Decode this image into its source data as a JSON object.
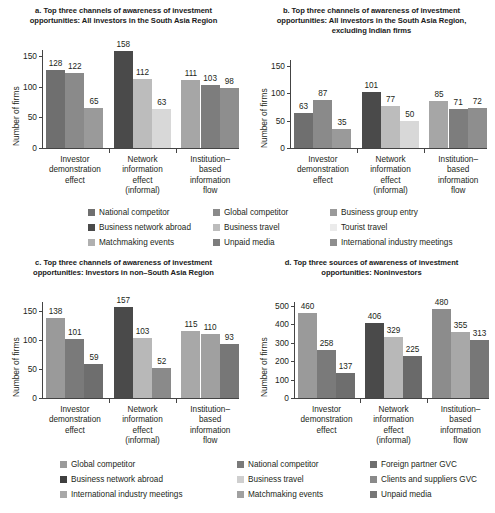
{
  "chart_data": [
    {
      "id": "a",
      "type": "bar",
      "title": "a. Top three channels of awareness of investment opportunities: All investors in the South Asia Region",
      "xlabel": "",
      "ylabel": "Number of firms",
      "ylim": [
        0,
        160
      ],
      "yticks": [
        0,
        50,
        100,
        150
      ],
      "grid": false,
      "categories": [
        "Investor demonstration effect",
        "Network information effect (informal)",
        "Institution–based information flow"
      ],
      "groups": [
        {
          "category": "Investor demonstration effect",
          "bars": [
            {
              "series": "National competitor",
              "value": 128,
              "color": "#6f6f6f"
            },
            {
              "series": "Global competitor",
              "value": 122,
              "color": "#8a8a8a"
            },
            {
              "series": "Business group entry",
              "value": 65,
              "color": "#9a9a9a"
            }
          ]
        },
        {
          "category": "Network information effect (informal)",
          "bars": [
            {
              "series": "Business network abroad",
              "value": 158,
              "color": "#4a4a4a"
            },
            {
              "series": "Business travel",
              "value": 112,
              "color": "#bcbcbc"
            },
            {
              "series": "Tourist travel",
              "value": 63,
              "color": "#d8d8d8"
            }
          ]
        },
        {
          "category": "Institution–based information flow",
          "bars": [
            {
              "series": "Matchmaking events",
              "value": 111,
              "color": "#a6a6a6"
            },
            {
              "series": "Unpaid media",
              "value": 103,
              "color": "#7d7d7d"
            },
            {
              "series": "International industry meetings",
              "value": 98,
              "color": "#8e8e8e"
            }
          ]
        }
      ]
    },
    {
      "id": "b",
      "type": "bar",
      "title": "b. Top three channels of awareness of investment opportunities: All investors in the South Asia Region, excluding Indian firms",
      "xlabel": "",
      "ylabel": "Number of firms",
      "ylim": [
        0,
        160
      ],
      "yticks": [
        0,
        50,
        100,
        150
      ],
      "grid": false,
      "categories": [
        "Investor demonstration effect",
        "Network information effect (informal)",
        "Institution–based information flow"
      ],
      "groups": [
        {
          "category": "Investor demonstration effect",
          "bars": [
            {
              "series": "National competitor",
              "value": 63,
              "color": "#6f6f6f"
            },
            {
              "series": "Global competitor",
              "value": 87,
              "color": "#8a8a8a"
            },
            {
              "series": "Business group entry",
              "value": 35,
              "color": "#9a9a9a"
            }
          ]
        },
        {
          "category": "Network information effect (informal)",
          "bars": [
            {
              "series": "Business network abroad",
              "value": 101,
              "color": "#4a4a4a"
            },
            {
              "series": "Business travel",
              "value": 77,
              "color": "#bcbcbc"
            },
            {
              "series": "Tourist travel",
              "value": 50,
              "color": "#d8d8d8"
            }
          ]
        },
        {
          "category": "Institution–based information flow",
          "bars": [
            {
              "series": "Matchmaking events",
              "value": 85,
              "color": "#a6a6a6"
            },
            {
              "series": "Unpaid media",
              "value": 71,
              "color": "#7d7d7d"
            },
            {
              "series": "International industry meetings",
              "value": 72,
              "color": "#8e8e8e"
            }
          ]
        }
      ]
    },
    {
      "id": "c",
      "type": "bar",
      "title": "c. Top three channels of awareness of investment opportunities: Investors in non–South Asia Region",
      "xlabel": "",
      "ylabel": "Number of firms",
      "ylim": [
        0,
        165
      ],
      "yticks": [
        0,
        50,
        100,
        150
      ],
      "grid": false,
      "categories": [
        "Investor demonstration effect",
        "Network information effect (informal)",
        "Institution–based information flow"
      ],
      "groups": [
        {
          "category": "Investor demonstration effect",
          "bars": [
            {
              "series": "Global competitor",
              "value": 138,
              "color": "#9a9a9a"
            },
            {
              "series": "National competitor",
              "value": 101,
              "color": "#7a7a7a"
            },
            {
              "series": "Foreign partner GVC",
              "value": 59,
              "color": "#6e6e6e"
            }
          ]
        },
        {
          "category": "Network information effect (informal)",
          "bars": [
            {
              "series": "Business network abroad",
              "value": 157,
              "color": "#4a4a4a"
            },
            {
              "series": "Business travel",
              "value": 103,
              "color": "#b8b8b8"
            },
            {
              "series": "Clients and suppliers GVC",
              "value": 52,
              "color": "#8a8a8a"
            }
          ]
        },
        {
          "category": "Institution–based information flow",
          "bars": [
            {
              "series": "International industry meetings",
              "value": 115,
              "color": "#a8a8a8"
            },
            {
              "series": "Matchmaking events",
              "value": 110,
              "color": "#a0a0a0"
            },
            {
              "series": "Unpaid media",
              "value": 93,
              "color": "#777777"
            }
          ]
        }
      ]
    },
    {
      "id": "d",
      "type": "bar",
      "title": "d. Top three sources of awareness of investment opportunities: Noninvestors",
      "xlabel": "",
      "ylabel": "Number of firms",
      "ylim": [
        0,
        520
      ],
      "yticks": [
        0,
        100,
        200,
        300,
        400,
        500
      ],
      "grid": false,
      "categories": [
        "Investor demonstration effect",
        "Network information effect (informal)",
        "Institution–based information flow"
      ],
      "groups": [
        {
          "category": "Investor demonstration effect",
          "bars": [
            {
              "series": "Global competitor",
              "value": 460,
              "color": "#9a9a9a"
            },
            {
              "series": "National competitor",
              "value": 258,
              "color": "#7a7a7a"
            },
            {
              "series": "Foreign partner GVC",
              "value": 137,
              "color": "#6e6e6e"
            }
          ]
        },
        {
          "category": "Network information effect (informal)",
          "bars": [
            {
              "series": "Business network abroad",
              "value": 406,
              "color": "#4a4a4a"
            },
            {
              "series": "Business travel",
              "value": 329,
              "color": "#b8b8b8"
            },
            {
              "series": "Clients and suppliers GVC",
              "value": 225,
              "color": "#6a6a6a"
            }
          ]
        },
        {
          "category": "Institution–based information flow",
          "bars": [
            {
              "series": "International industry meetings",
              "value": 480,
              "color": "#8c8c8c"
            },
            {
              "series": "Matchmaking events",
              "value": 355,
              "color": "#a8a8a8"
            },
            {
              "series": "Unpaid media",
              "value": 313,
              "color": "#777777"
            }
          ]
        }
      ]
    }
  ],
  "legend_top": {
    "rows": [
      [
        {
          "label": "National competitor",
          "color": "#6f6f6f"
        },
        {
          "label": "Global competitor",
          "color": "#8a8a8a"
        },
        {
          "label": "Business group entry",
          "color": "#9a9a9a"
        }
      ],
      [
        {
          "label": "Business network abroad",
          "color": "#4a4a4a"
        },
        {
          "label": "Business travel",
          "color": "#bcbcbc"
        },
        {
          "label": "Tourist travel",
          "color": "#ebebeb"
        }
      ],
      [
        {
          "label": "Matchmaking events",
          "color": "#b0b0b0"
        },
        {
          "label": "Unpaid media",
          "color": "#7d7d7d"
        },
        {
          "label": "International industry meetings",
          "color": "#8e8e8e"
        }
      ]
    ]
  },
  "legend_bottom": {
    "rows": [
      [
        {
          "label": "Global competitor",
          "color": "#9a9a9a"
        },
        {
          "label": "National competitor",
          "color": "#7a7a7a"
        },
        {
          "label": "Foreign partner GVC",
          "color": "#6e6e6e"
        }
      ],
      [
        {
          "label": "Business network abroad",
          "color": "#3f3f3f"
        },
        {
          "label": "Business travel",
          "color": "#cfcfcf"
        },
        {
          "label": "Clients and suppliers GVC",
          "color": "#8a8a8a"
        }
      ],
      [
        {
          "label": "International industry meetings",
          "color": "#a8a8a8"
        },
        {
          "label": "Matchmaking events",
          "color": "#a0a0a0"
        },
        {
          "label": "Unpaid media",
          "color": "#777777"
        }
      ]
    ]
  }
}
